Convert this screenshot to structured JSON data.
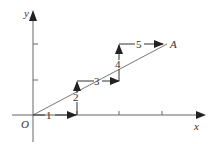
{
  "diagram": {
    "axes": {
      "x_label": "x",
      "y_label": "y",
      "origin_label": "O"
    },
    "endpoint_label": "A",
    "steps": [
      {
        "label": "1",
        "direction": "right"
      },
      {
        "label": "2",
        "direction": "up"
      },
      {
        "label": "3",
        "direction": "right"
      },
      {
        "label": "4",
        "direction": "up"
      },
      {
        "label": "5",
        "direction": "right"
      }
    ],
    "colors": {
      "stroke": "#333333",
      "line": "#555555",
      "background": "#ffffff"
    }
  }
}
